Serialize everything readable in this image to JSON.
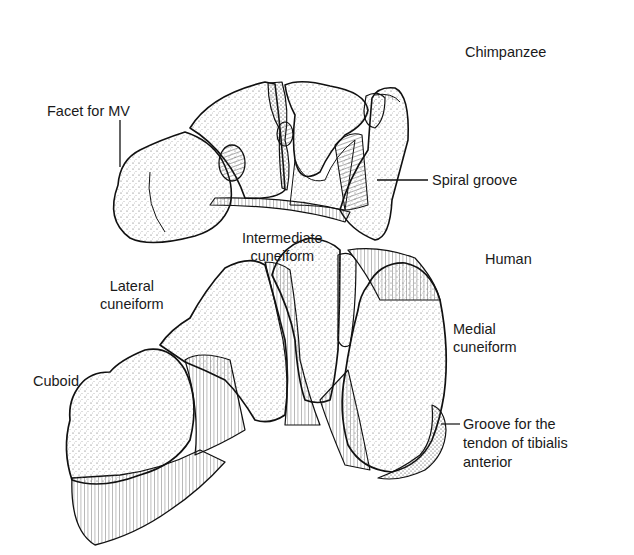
{
  "figure": {
    "panels": [
      {
        "id": "chimpanzee",
        "title": "Chimpanzee",
        "labels": [
          {
            "text": "Facet for MV"
          },
          {
            "text": "Spiral groove"
          }
        ]
      },
      {
        "id": "human",
        "title": "Human",
        "labels": [
          {
            "text": "Intermediate cuneiform",
            "lines": [
              "Intermediate",
              "cuneiform"
            ]
          },
          {
            "text": "Lateral cuneiform",
            "lines": [
              "Lateral",
              "cuneiform"
            ]
          },
          {
            "text": "Medial cuneiform",
            "lines": [
              "Medial",
              "cuneiform"
            ]
          },
          {
            "text": "Cuboid"
          },
          {
            "text": "Groove for the tendon of tibialis anterior",
            "lines": [
              "Groove for the",
              "tendon of tibialis",
              "anterior"
            ]
          }
        ]
      }
    ]
  }
}
